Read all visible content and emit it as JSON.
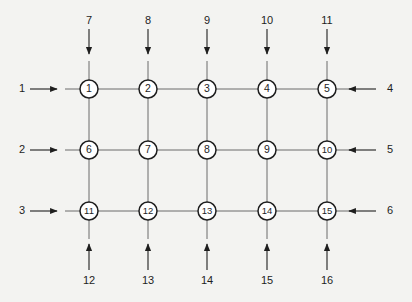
{
  "diagram": {
    "type": "grid-network",
    "colors": {
      "background": "#f3f3f1",
      "line": "#6a6a6a",
      "node_stroke": "#1e1e1e",
      "node_fill": "#ffffff",
      "arrow": "#1e1e1e",
      "text": "#1e1e1e"
    },
    "columns_x": [
      89,
      148,
      207,
      267,
      327
    ],
    "rows_y": [
      89,
      150,
      211
    ],
    "nodes": [
      {
        "id": "1",
        "label": "1",
        "row": 0,
        "col": 0
      },
      {
        "id": "2",
        "label": "2",
        "row": 0,
        "col": 1
      },
      {
        "id": "3",
        "label": "3",
        "row": 0,
        "col": 2
      },
      {
        "id": "4",
        "label": "4",
        "row": 0,
        "col": 3
      },
      {
        "id": "5",
        "label": "5",
        "row": 0,
        "col": 4
      },
      {
        "id": "6",
        "label": "6",
        "row": 1,
        "col": 0
      },
      {
        "id": "7",
        "label": "7",
        "row": 1,
        "col": 1
      },
      {
        "id": "8",
        "label": "8",
        "row": 1,
        "col": 2
      },
      {
        "id": "9",
        "label": "9",
        "row": 1,
        "col": 3
      },
      {
        "id": "10",
        "label": "10",
        "row": 1,
        "col": 4
      },
      {
        "id": "11",
        "label": "11",
        "row": 2,
        "col": 0
      },
      {
        "id": "12",
        "label": "12",
        "row": 2,
        "col": 1
      },
      {
        "id": "13",
        "label": "13",
        "row": 2,
        "col": 2
      },
      {
        "id": "14",
        "label": "14",
        "row": 2,
        "col": 3
      },
      {
        "id": "15",
        "label": "15",
        "row": 2,
        "col": 4
      }
    ],
    "inputs_left": [
      {
        "label": "1",
        "row": 0
      },
      {
        "label": "2",
        "row": 1
      },
      {
        "label": "3",
        "row": 2
      }
    ],
    "inputs_right": [
      {
        "label": "4",
        "row": 0
      },
      {
        "label": "5",
        "row": 1
      },
      {
        "label": "6",
        "row": 2
      }
    ],
    "inputs_top": [
      {
        "label": "7",
        "col": 0
      },
      {
        "label": "8",
        "col": 1
      },
      {
        "label": "9",
        "col": 2
      },
      {
        "label": "10",
        "col": 3
      },
      {
        "label": "11",
        "col": 4
      }
    ],
    "inputs_bottom": [
      {
        "label": "12",
        "col": 0
      },
      {
        "label": "13",
        "col": 1
      },
      {
        "label": "14",
        "col": 2
      },
      {
        "label": "15",
        "col": 3
      },
      {
        "label": "16",
        "col": 4
      }
    ]
  }
}
